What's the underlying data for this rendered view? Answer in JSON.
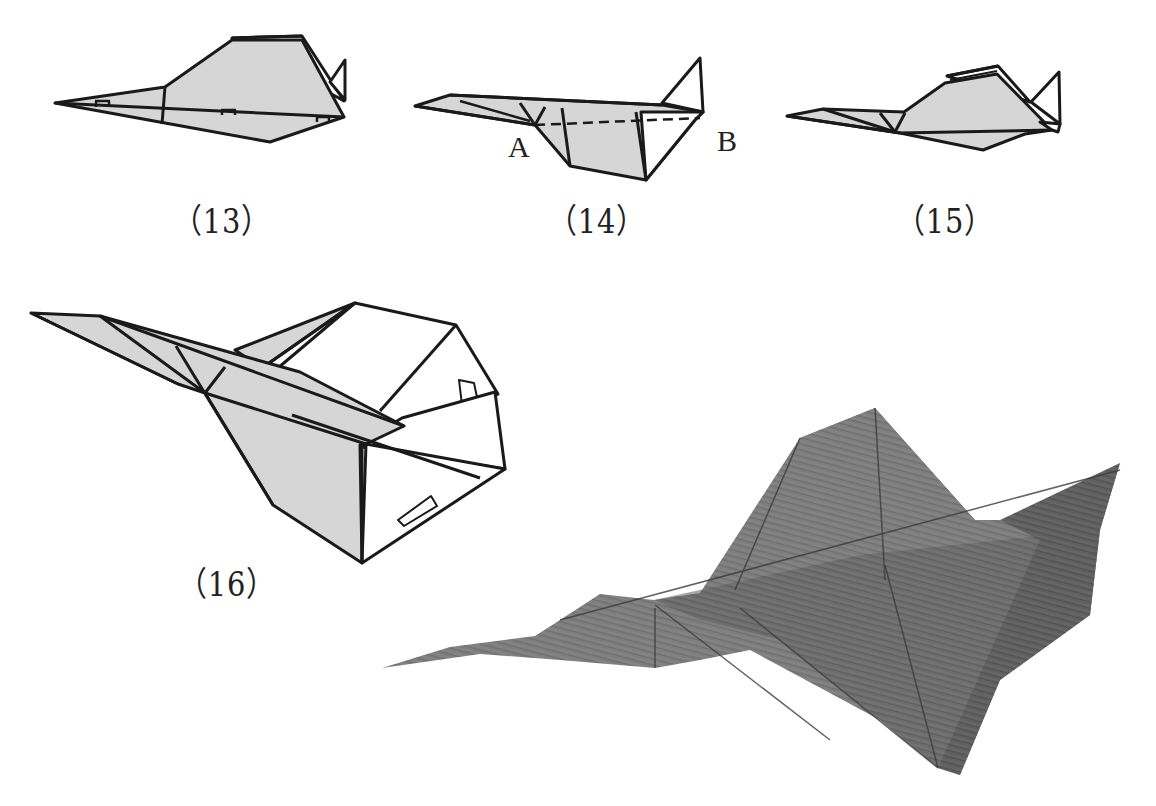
{
  "figure": {
    "type": "origami-instructions",
    "colors": {
      "paper_fill": "#d6d6d6",
      "line": "#1a1a1a",
      "photo_paper": "#7c7c7c",
      "photo_shadow": "#555555",
      "background": "#ffffff"
    }
  },
  "steps": [
    {
      "id": "13",
      "label": "（13）"
    },
    {
      "id": "14",
      "label": "（14）",
      "points": {
        "a": "A",
        "b": "B"
      },
      "fold_line": "dashed A–B"
    },
    {
      "id": "15",
      "label": "（15）"
    },
    {
      "id": "16",
      "label": "（16）"
    }
  ],
  "photo": {
    "description": "finished folded paper airplane photograph"
  }
}
